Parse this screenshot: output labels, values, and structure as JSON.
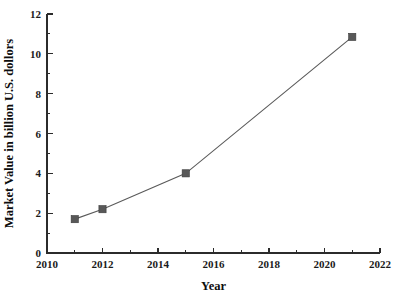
{
  "chart_data": {
    "type": "line",
    "title": "",
    "xlabel": "Year",
    "ylabel": "Market Value in billion U.S. dollors",
    "xlim": [
      2010,
      2022
    ],
    "ylim": [
      0,
      12
    ],
    "grid": false,
    "legend": "none",
    "marker": "square",
    "series": [
      {
        "name": "Market Value",
        "x": [
          2011,
          2012,
          2015,
          2021
        ],
        "values": [
          1.7,
          2.2,
          4.0,
          10.85
        ]
      }
    ],
    "x_ticks": [
      2010,
      2012,
      2014,
      2016,
      2018,
      2020,
      2022
    ],
    "x_tick_labels": [
      "2010",
      "2012",
      "2014",
      "2016",
      "2018",
      "2020",
      "2022"
    ],
    "x_minor_ticks": [
      2011,
      2013,
      2015,
      2017,
      2019,
      2021
    ],
    "y_ticks": [
      0,
      2,
      4,
      6,
      8,
      10,
      12
    ],
    "y_tick_labels": [
      "0",
      "2",
      "4",
      "6",
      "8",
      "10",
      "12"
    ],
    "y_minor_ticks": [
      1,
      3,
      5,
      7,
      9,
      11
    ],
    "colors": {
      "line": "#5a5a5a",
      "marker": "#585858",
      "axis": "#2b2b2b",
      "text": "#1a1a1a",
      "background": "#ffffff"
    }
  }
}
